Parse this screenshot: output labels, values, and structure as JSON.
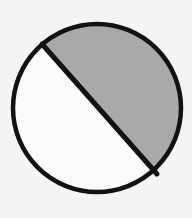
{
  "figure": {
    "name": "circle-with-shaded-segment",
    "canvas": {
      "width": 192,
      "height": 218,
      "background_color": "#f4f4f2"
    },
    "colors": {
      "outline": "#121212",
      "chord": "#121212",
      "shaded_fill": "#a9a9a9",
      "unshaded_fill": "#fbfbfb",
      "background": "#f4f4f2"
    },
    "circle": {
      "label": "circle-outline",
      "center_x": 97,
      "center_y": 108,
      "radius": 84,
      "stroke_width": 4.5,
      "stroke_color": "#121212",
      "fill": "#fbfbfb"
    },
    "chord": {
      "label": "diagonal-chord",
      "x1": 42,
      "y1": 44,
      "x2": 157,
      "y2": 174,
      "stroke_width": 5,
      "stroke_color": "#121212",
      "orientation": "upper-left to lower-right"
    },
    "regions": [
      {
        "name": "shaded-segment",
        "position": "upper-right",
        "fill": "#a9a9a9",
        "shaded": "true",
        "share": "major"
      },
      {
        "name": "unshaded-segment",
        "position": "lower-left",
        "fill": "#fbfbfb",
        "shaded": "false",
        "share": "minor"
      }
    ]
  }
}
